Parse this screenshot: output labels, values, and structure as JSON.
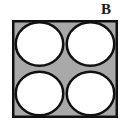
{
  "figure": {
    "label": "B",
    "caption_letter": "B",
    "colors": {
      "background": "#ffffff",
      "container_fill": "#a9a9a9",
      "container_stroke": "#111111",
      "circle_fill": "#ffffff",
      "circle_stroke": "#111111",
      "label_color": "#1a1a1a"
    },
    "container": {
      "name": "square",
      "x": 12,
      "y": 20,
      "width": 106,
      "height": 98,
      "stroke_width": 2.5
    },
    "circles": [
      {
        "name": "circle-top-left",
        "cx": 39.5,
        "cy": 44.0,
        "rx": 25.0,
        "ry": 23.0
      },
      {
        "name": "circle-top-right",
        "cx": 90.5,
        "cy": 44.0,
        "rx": 25.0,
        "ry": 23.0
      },
      {
        "name": "circle-bottom-left",
        "cx": 39.5,
        "cy": 93.5,
        "rx": 25.0,
        "ry": 23.0
      },
      {
        "name": "circle-bottom-right",
        "cx": 90.5,
        "cy": 93.5,
        "rx": 25.0,
        "ry": 23.0
      }
    ],
    "circle_count": 4,
    "circle_stroke_width": 2.5,
    "rows": 2,
    "columns": 2
  }
}
